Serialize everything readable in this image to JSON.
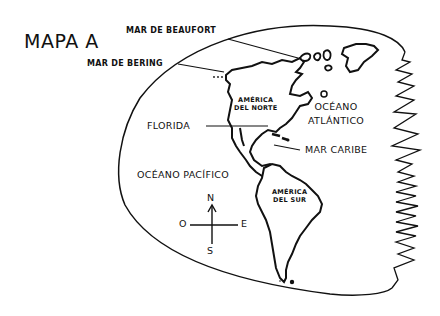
{
  "map": {
    "title": "MAPA A",
    "labels": {
      "beaufort": "MAR DE BEAUFORT",
      "bering": "MAR DE BERING",
      "north_america_line1": "AMÉRICA",
      "north_america_line2": "DEL NORTE",
      "atlantic_line1": "OCÉANO",
      "atlantic_line2": "ATLÁNTICO",
      "florida": "FLORIDA",
      "caribbean": "MAR CARIBE",
      "pacific": "OCÉANO PACÍFICO",
      "south_america_line1": "AMÉRICA",
      "south_america_line2": "DEL SUR"
    },
    "compass": {
      "north": "N",
      "south": "S",
      "east": "E",
      "west": "O"
    },
    "colors": {
      "ink": "#111111",
      "background": "#ffffff"
    }
  }
}
